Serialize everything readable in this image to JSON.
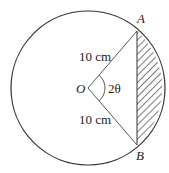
{
  "diagram": {
    "type": "circle-segment",
    "center": {
      "label": "O",
      "x": 88,
      "y": 88
    },
    "radius_px": 77,
    "points": {
      "A": {
        "label": "A",
        "x": 137,
        "y": 31
      },
      "B": {
        "label": "B",
        "x": 137,
        "y": 145
      }
    },
    "radius_labels": {
      "OA": "10 cm",
      "OB": "10 cm"
    },
    "angle_label": "2θ",
    "shaded_region": "minor segment between chord AB and arc AB (hatched)",
    "colors": {
      "stroke": "#333333",
      "hatch": "#333333",
      "background": "#ffffff"
    }
  }
}
